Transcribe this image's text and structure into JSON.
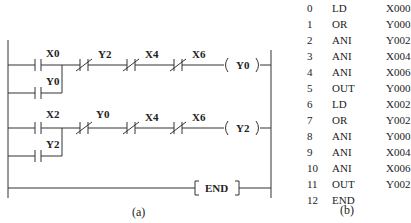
{
  "ladder": {
    "caption": "(a)",
    "rungs": [
      {
        "contacts": [
          {
            "name": "X0",
            "type": "NO"
          },
          {
            "name": "Y2",
            "type": "NC"
          },
          {
            "name": "X4",
            "type": "NC"
          },
          {
            "name": "X6",
            "type": "NC"
          }
        ],
        "branch": {
          "name": "Y0",
          "type": "NO"
        },
        "coil": "Y0"
      },
      {
        "contacts": [
          {
            "name": "X2",
            "type": "NO"
          },
          {
            "name": "Y0",
            "type": "NC"
          },
          {
            "name": "X4",
            "type": "NC"
          },
          {
            "name": "X6",
            "type": "NC"
          }
        ],
        "branch": {
          "name": "Y2",
          "type": "NO"
        },
        "coil": "Y2"
      }
    ],
    "end_label": "END"
  },
  "instruction_list": {
    "caption": "(b)",
    "rows": [
      {
        "step": "0",
        "op": "LD",
        "arg": "X000"
      },
      {
        "step": "1",
        "op": "OR",
        "arg": "Y000"
      },
      {
        "step": "2",
        "op": "ANI",
        "arg": "Y002"
      },
      {
        "step": "3",
        "op": "ANI",
        "arg": "X004"
      },
      {
        "step": "4",
        "op": "ANI",
        "arg": "X006"
      },
      {
        "step": "5",
        "op": "OUT",
        "arg": "Y000"
      },
      {
        "step": "6",
        "op": "LD",
        "arg": "X002"
      },
      {
        "step": "7",
        "op": "OR",
        "arg": "Y002"
      },
      {
        "step": "8",
        "op": "ANI",
        "arg": "Y000"
      },
      {
        "step": "9",
        "op": "ANI",
        "arg": "X004"
      },
      {
        "step": "10",
        "op": "ANI",
        "arg": "X006"
      },
      {
        "step": "11",
        "op": "OUT",
        "arg": "Y002"
      },
      {
        "step": "12",
        "op": "END",
        "arg": ""
      }
    ]
  }
}
